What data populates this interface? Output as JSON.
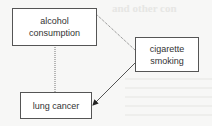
{
  "diagram": {
    "nodes": [
      {
        "id": "alcohol",
        "label": "alcohol consumption",
        "lines": [
          "alcohol",
          "consumption"
        ]
      },
      {
        "id": "smoking",
        "label": "cigarette smoking",
        "lines": [
          "cigarette",
          "smoking"
        ]
      },
      {
        "id": "cancer",
        "label": "lung cancer",
        "lines": [
          "lung cancer"
        ]
      }
    ],
    "edges": [
      {
        "from": "alcohol",
        "to": "cancer",
        "style": "dotted",
        "arrow": false
      },
      {
        "from": "smoking",
        "to": "alcohol",
        "style": "dotted",
        "arrow": false
      },
      {
        "from": "smoking",
        "to": "cancer",
        "style": "solid",
        "arrow": true
      }
    ],
    "background_bleed_text": "and other con"
  },
  "colors": {
    "background": "#f7f7f6",
    "box_border": "#555555",
    "text": "#333333",
    "line": "#666666"
  }
}
